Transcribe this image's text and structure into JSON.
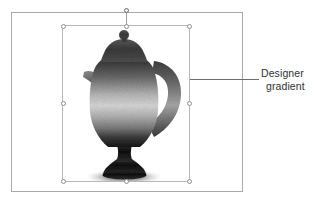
{
  "canvas": {
    "name": "slide-canvas",
    "background_color": "#ffffff",
    "border_color": "#a9a9a9"
  },
  "selection": {
    "border_color": "#b8b8bd",
    "handle_fill": "#ffffff",
    "handle_border": "#8e8e95",
    "handles": [
      "top-left",
      "top-center",
      "top-right",
      "middle-left",
      "middle-right",
      "bottom-left",
      "bottom-center",
      "bottom-right"
    ],
    "rotation_handle": "rotate-handle"
  },
  "artwork": {
    "name": "teapot-shape",
    "description": "coffee pot / teapot silhouette",
    "fill_style": "grainy vertical gradient",
    "gradient_stops": [
      "#3a3a3a",
      "#f0f0f0",
      "#1c1c1c"
    ],
    "parts": [
      "finial-knob",
      "lid",
      "body",
      "spout",
      "loop-handle",
      "pedestal-foot",
      "shadow"
    ]
  },
  "callout": {
    "line_color": "#6d6d72",
    "text_line_1": "Designer",
    "text_line_2": "gradient",
    "text_color": "#2f2f33"
  }
}
